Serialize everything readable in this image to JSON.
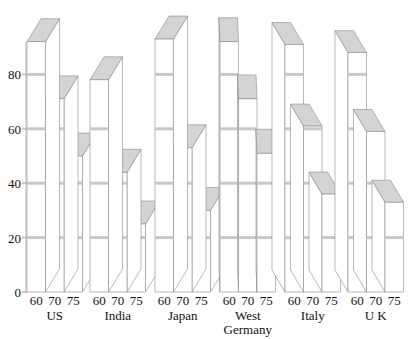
{
  "chart_data": {
    "type": "bar",
    "style": "3d-grouped",
    "title": "",
    "xlabel": "",
    "ylabel": "",
    "ylim": [
      0,
      100
    ],
    "yticks": [
      0,
      20,
      40,
      60,
      80
    ],
    "grid": false,
    "legend": null,
    "categories": [
      "60",
      "70",
      "75"
    ],
    "groups": [
      {
        "name": "US",
        "label_lines": [
          "US"
        ],
        "values": [
          92,
          71,
          50
        ]
      },
      {
        "name": "India",
        "label_lines": [
          "India"
        ],
        "values": [
          78,
          44,
          25
        ]
      },
      {
        "name": "Japan",
        "label_lines": [
          "Japan"
        ],
        "values": [
          93,
          53,
          30
        ]
      },
      {
        "name": "West Germany",
        "label_lines": [
          "West",
          "Germany"
        ],
        "values": [
          92,
          71,
          51
        ]
      },
      {
        "name": "Italy",
        "label_lines": [
          "Italy"
        ],
        "values": [
          91,
          61,
          36
        ]
      },
      {
        "name": "UK",
        "label_lines": [
          "U K"
        ],
        "values": [
          88,
          59,
          33
        ]
      }
    ]
  },
  "colors": {
    "face": "#ffffff",
    "top": "#d4d4d4",
    "edge": "#8a8a8a",
    "band": "#c8c8c8",
    "text": "#111111"
  }
}
